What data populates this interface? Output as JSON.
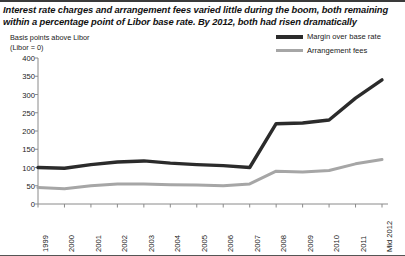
{
  "headline": "Interest rate charges and arrangement fees varied little during the boom, both remaining within a percentage point of Libor base rate. By 2012, both had risen dramatically",
  "axis_note_line1": "Basis points above Libor",
  "axis_note_line2": "(Libor = 0)",
  "colors": {
    "margin_line": "#2b2b2b",
    "fees_line": "#a6a6a6",
    "axis": "#8a8a8a",
    "rule": "#3a3a3a",
    "text": "#1a1a1a"
  },
  "legend": {
    "position": "top-right",
    "items": [
      {
        "label": "Margin over base rate",
        "swatch": "dark"
      },
      {
        "label": "Arrangement fees",
        "swatch": "grey"
      }
    ]
  },
  "chart_data": {
    "type": "line",
    "title": "Interest rate charges and arrangement fees varied little during the boom, both remaining within a percentage point of Libor base rate. By 2012, both had risen dramatically",
    "subtitle": "",
    "xlabel": "",
    "ylabel": "Basis points above Libor (Libor = 0)",
    "categories": [
      "1999",
      "2000",
      "2001",
      "2002",
      "2003",
      "2004",
      "2005",
      "2006",
      "2007",
      "2008",
      "2009",
      "2010",
      "2011",
      "Mid 2012"
    ],
    "ylim": [
      0,
      400
    ],
    "yticks": [
      0,
      50,
      100,
      150,
      200,
      250,
      300,
      350,
      400
    ],
    "grid": false,
    "legend_position": "top-right",
    "series": [
      {
        "name": "Margin over base rate",
        "color": "#2b2b2b",
        "values": [
          100,
          98,
          108,
          115,
          118,
          112,
          108,
          105,
          100,
          220,
          222,
          230,
          290,
          340
        ]
      },
      {
        "name": "Arrangement fees",
        "color": "#a6a6a6",
        "values": [
          45,
          42,
          50,
          55,
          55,
          53,
          52,
          50,
          55,
          90,
          88,
          92,
          110,
          122
        ]
      }
    ]
  }
}
